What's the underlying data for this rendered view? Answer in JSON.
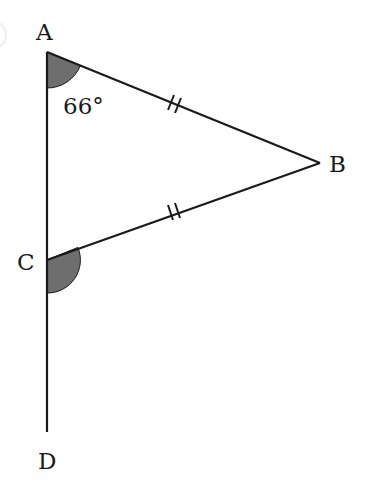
{
  "diagram": {
    "type": "geometry-triangle",
    "points": {
      "A": {
        "label": "A",
        "x": 47,
        "y": 52
      },
      "B": {
        "label": "B",
        "x": 320,
        "y": 163
      },
      "C": {
        "label": "C",
        "x": 47,
        "y": 260
      },
      "D": {
        "label": "D",
        "x": 47,
        "y": 432
      }
    },
    "segments": [
      {
        "from": "A",
        "to": "B",
        "ticks": 2
      },
      {
        "from": "C",
        "to": "B",
        "ticks": 2
      },
      {
        "from": "A",
        "to": "D",
        "ticks": 0
      }
    ],
    "angles": [
      {
        "vertex": "A",
        "label": "66°",
        "shaded": true
      },
      {
        "vertex": "C",
        "label": "",
        "shaded": true,
        "between": [
          "B",
          "D"
        ]
      }
    ],
    "colors": {
      "line": "#1a1a1a",
      "shade": "#6e6e6e"
    }
  }
}
